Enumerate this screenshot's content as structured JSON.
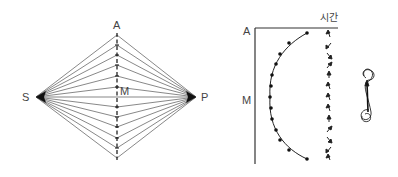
{
  "figure": {
    "left_diagram": {
      "labels": {
        "top": "A",
        "left": "S",
        "right": "P",
        "center": "M"
      },
      "num_rays": 13
    },
    "right_diagram": {
      "labels": {
        "axis_top": "A",
        "axis_mid": "M",
        "time_axis": "시간"
      },
      "curve_points": 13
    }
  },
  "colors": {
    "line": "#444444",
    "dark": "#111111",
    "background": "#ffffff"
  }
}
